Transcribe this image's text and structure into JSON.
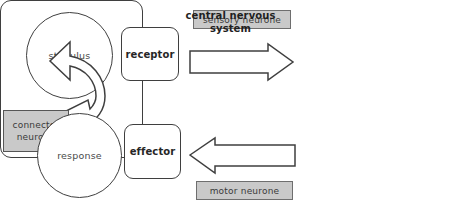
{
  "diagram": {
    "background_color": "#ffffff",
    "outline_color": "#3f3f3f",
    "plate_fill_color": "#c9c9c9",
    "nodes": {
      "stimulus": {
        "label": "stimulus",
        "shape": "circle"
      },
      "receptor": {
        "label": "receptor",
        "shape": "rounded-square"
      },
      "cns": {
        "label": "central nervous system",
        "line1": "central nervous",
        "line2": "system",
        "shape": "rounded-rectangle"
      },
      "connector": {
        "label": "connector neurone",
        "line1": "connector",
        "line2": "neurone",
        "shape": "rectangle"
      },
      "effector": {
        "label": "effector",
        "shape": "rounded-square"
      },
      "response": {
        "label": "response",
        "shape": "circle"
      }
    },
    "labels": {
      "sensory_neurone": "sensory neurone",
      "motor_neurone": "motor neurone"
    },
    "arrows": {
      "sensory": {
        "name": "receptor-to-cns",
        "direction": "right"
      },
      "motor": {
        "name": "cns-to-effector",
        "direction": "left"
      },
      "curved": {
        "name": "cns-internal-relay",
        "direction": "clockwise-to-left"
      }
    }
  }
}
